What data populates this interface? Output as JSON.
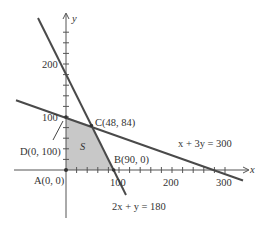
{
  "axes": {
    "x_label": "x",
    "y_label": "y",
    "x_ticks": [
      {
        "value": 100,
        "label": "100"
      },
      {
        "value": 200,
        "label": "200"
      },
      {
        "value": 300,
        "label": "300"
      }
    ],
    "y_ticks": [
      {
        "value": 100,
        "label": "100"
      },
      {
        "value": 200,
        "label": "200"
      }
    ]
  },
  "lines": [
    {
      "name": "line-x-3y",
      "equation": "x + 3y = 300"
    },
    {
      "name": "line-2x-y",
      "equation": "2x + y = 180"
    }
  ],
  "region": {
    "label": "S",
    "color": "#c8c8c8"
  },
  "points": {
    "A": {
      "label": "A(0, 0)"
    },
    "B": {
      "label": "B(90, 0)"
    },
    "C": {
      "label": "C(48, 84)"
    },
    "D": {
      "label": "D(0, 100)"
    }
  },
  "colors": {
    "line": "#4a4a4a",
    "axis": "#555555",
    "region": "#c8c8c8"
  }
}
